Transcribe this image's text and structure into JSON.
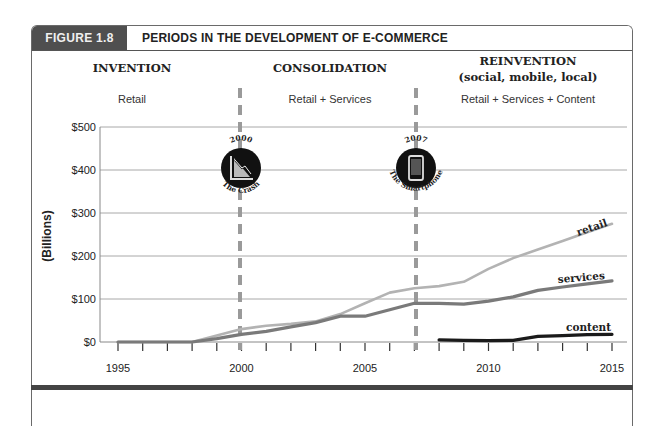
{
  "figure": {
    "tag": "FIGURE 1.8",
    "title": "PERIODS IN THE DEVELOPMENT OF E-COMMERCE"
  },
  "periods": [
    {
      "title": "INVENTION",
      "subtitle_line": "",
      "description": "Retail"
    },
    {
      "title": "CONSOLIDATION",
      "subtitle_line": "",
      "description": "Retail + Services"
    },
    {
      "title": "REINVENTION",
      "subtitle_line": "(social, mobile, local)",
      "description": "Retail + Services + Content"
    }
  ],
  "milestones": [
    {
      "year": "2000",
      "label": "The Crash",
      "icon": "declining-chart-icon"
    },
    {
      "year": "2007",
      "label": "The Smartphone",
      "icon": "smartphone-icon"
    }
  ],
  "colors": {
    "retail": "#b3b3b3",
    "services": "#7a7a7a",
    "content": "#1a1a1a",
    "divider": "#9a9a9a",
    "grid": "#a8a8a8",
    "header_tag_bg": "#4f4f4f"
  },
  "chart_data": {
    "type": "line",
    "title": "PERIODS IN THE DEVELOPMENT OF E-COMMERCE",
    "xlabel": "",
    "ylabel": "(Billions)",
    "ylim": [
      0,
      500
    ],
    "xlim": [
      1995,
      2015
    ],
    "y_ticks": [
      "$0",
      "$100",
      "$200",
      "$300",
      "$400",
      "$500"
    ],
    "x_ticks": [
      "1995",
      "2000",
      "2005",
      "2010",
      "2015"
    ],
    "grid": true,
    "legend": "inline labels at line ends",
    "vertical_markers": [
      {
        "x": 2000,
        "label": "The Crash"
      },
      {
        "x": 2007,
        "label": "The Smartphone"
      }
    ],
    "series": [
      {
        "name": "retail",
        "x": [
          1995,
          1996,
          1997,
          1998,
          1999,
          2000,
          2001,
          2002,
          2003,
          2004,
          2005,
          2006,
          2007,
          2008,
          2009,
          2010,
          2011,
          2012,
          2013,
          2014,
          2015
        ],
        "values": [
          0,
          0,
          0,
          0,
          15,
          30,
          38,
          42,
          48,
          65,
          90,
          115,
          125,
          130,
          140,
          170,
          195,
          215,
          235,
          255,
          275
        ]
      },
      {
        "name": "services",
        "x": [
          1995,
          1996,
          1997,
          1998,
          1999,
          2000,
          2001,
          2002,
          2003,
          2004,
          2005,
          2006,
          2007,
          2008,
          2009,
          2010,
          2011,
          2012,
          2013,
          2014,
          2015
        ],
        "values": [
          0,
          0,
          0,
          0,
          8,
          18,
          25,
          35,
          45,
          60,
          60,
          75,
          90,
          90,
          88,
          95,
          105,
          120,
          128,
          135,
          142
        ]
      },
      {
        "name": "content",
        "x": [
          2008,
          2009,
          2010,
          2011,
          2012,
          2013,
          2014,
          2015
        ],
        "values": [
          5,
          4,
          3,
          4,
          13,
          15,
          17,
          18
        ]
      }
    ]
  }
}
